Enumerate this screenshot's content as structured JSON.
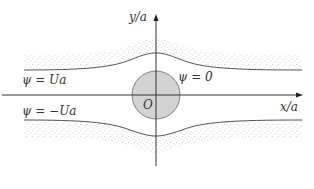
{
  "diagram": {
    "axes": {
      "x_label": "x/a",
      "y_label": "y/a"
    },
    "origin_label": "O",
    "streamlines": [
      {
        "label": "ψ = Ua",
        "position": "upper"
      },
      {
        "label": "ψ = 0",
        "position": "center"
      },
      {
        "label": "ψ = −Ua",
        "position": "lower"
      }
    ],
    "colors": {
      "axis": "#333333",
      "curve": "#555555",
      "cylinder_fill": "#d3d3d3",
      "cylinder_stroke": "#666666",
      "stipple": "#9a9a9a"
    }
  }
}
